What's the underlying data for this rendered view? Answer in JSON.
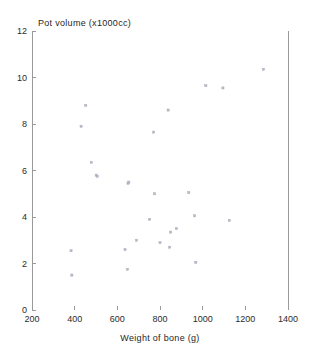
{
  "figure": {
    "title": "Pot volume (x1000cc)",
    "xlabel": "Weight of bone (g)",
    "background": "#ffffff",
    "axis_color": "#9a9a9a",
    "marker_color": "#b9b9c6"
  },
  "axes": {
    "x_ticks": [
      "200",
      "400",
      "600",
      "800",
      "1000",
      "1200",
      "1400"
    ],
    "y_ticks": [
      "0",
      "2",
      "4",
      "6",
      "8",
      "10",
      "12"
    ]
  },
  "chart_data": {
    "type": "scatter",
    "title": "Pot volume (x1000cc)",
    "xlabel": "Weight of bone (g)",
    "ylabel": "Pot volume (x1000cc)",
    "xlim": [
      200,
      1400
    ],
    "ylim": [
      0,
      12
    ],
    "xticks": [
      200,
      400,
      600,
      800,
      1000,
      1200,
      1400
    ],
    "yticks": [
      0,
      2,
      4,
      6,
      8,
      10,
      12
    ],
    "grid": false,
    "legend": null,
    "x": [
      383,
      387,
      452,
      430,
      478,
      501,
      506,
      636,
      648,
      650,
      654,
      690,
      751,
      770,
      775,
      800,
      838,
      845,
      850,
      877,
      935,
      962,
      968,
      1015,
      1095,
      1125,
      1285
    ],
    "y": [
      2.55,
      1.5,
      8.8,
      7.9,
      6.35,
      5.8,
      5.75,
      2.6,
      1.75,
      5.45,
      5.5,
      3.0,
      3.9,
      7.65,
      5.0,
      2.9,
      8.6,
      2.7,
      3.35,
      3.5,
      5.05,
      4.05,
      2.05,
      9.65,
      9.55,
      3.85,
      10.35
    ],
    "points": [
      {
        "x": 383,
        "y": 2.55
      },
      {
        "x": 387,
        "y": 1.5
      },
      {
        "x": 430,
        "y": 7.9
      },
      {
        "x": 452,
        "y": 8.8
      },
      {
        "x": 478,
        "y": 6.35
      },
      {
        "x": 501,
        "y": 5.8
      },
      {
        "x": 506,
        "y": 5.75
      },
      {
        "x": 636,
        "y": 2.6
      },
      {
        "x": 648,
        "y": 1.75
      },
      {
        "x": 650,
        "y": 5.45
      },
      {
        "x": 654,
        "y": 5.5
      },
      {
        "x": 690,
        "y": 3.0
      },
      {
        "x": 751,
        "y": 3.9
      },
      {
        "x": 770,
        "y": 7.65
      },
      {
        "x": 775,
        "y": 5.0
      },
      {
        "x": 800,
        "y": 2.9
      },
      {
        "x": 838,
        "y": 8.6
      },
      {
        "x": 845,
        "y": 2.7
      },
      {
        "x": 850,
        "y": 3.35
      },
      {
        "x": 877,
        "y": 3.5
      },
      {
        "x": 935,
        "y": 5.05
      },
      {
        "x": 962,
        "y": 4.05
      },
      {
        "x": 968,
        "y": 2.05
      },
      {
        "x": 1015,
        "y": 9.65
      },
      {
        "x": 1095,
        "y": 9.55
      },
      {
        "x": 1125,
        "y": 3.85
      },
      {
        "x": 1285,
        "y": 10.35
      }
    ]
  }
}
